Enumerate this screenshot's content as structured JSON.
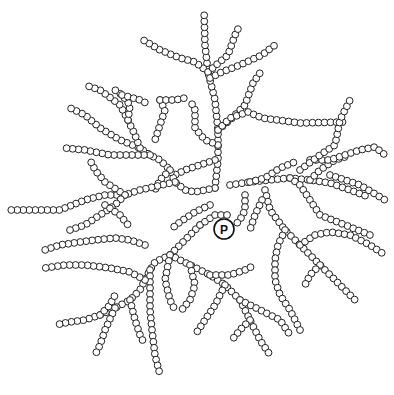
{
  "diagram": {
    "type": "branched-polymer",
    "bead_radius": 3.4,
    "bead_spacing": 6,
    "colors": {
      "stroke": "#222222",
      "fill": "#ffffff",
      "background": "#ffffff"
    },
    "core": {
      "label": "P",
      "x": 224,
      "y": 229,
      "r": 10
    },
    "chains": [
      [
        [
          215,
          188
        ],
        [
          218,
          160
        ],
        [
          218,
          130
        ],
        [
          215,
          100
        ],
        [
          208,
          72
        ],
        [
          205,
          45
        ],
        [
          204,
          10
        ]
      ],
      [
        [
          208,
          72
        ],
        [
          195,
          62
        ],
        [
          180,
          58
        ],
        [
          160,
          50
        ],
        [
          140,
          38
        ]
      ],
      [
        [
          208,
          72
        ],
        [
          228,
          55
        ],
        [
          235,
          35
        ],
        [
          240,
          25
        ]
      ],
      [
        [
          210,
          78
        ],
        [
          222,
          72
        ],
        [
          240,
          65
        ],
        [
          262,
          55
        ],
        [
          275,
          45
        ]
      ],
      [
        [
          218,
          130
        ],
        [
          230,
          120
        ],
        [
          245,
          105
        ],
        [
          253,
          83
        ],
        [
          262,
          70
        ]
      ],
      [
        [
          218,
          130
        ],
        [
          230,
          118
        ],
        [
          248,
          112
        ],
        [
          262,
          118
        ],
        [
          300,
          123
        ],
        [
          345,
          122
        ]
      ],
      [
        [
          218,
          145
        ],
        [
          205,
          140
        ],
        [
          195,
          128
        ],
        [
          195,
          110
        ],
        [
          190,
          100
        ]
      ],
      [
        [
          215,
          160
        ],
        [
          200,
          165
        ],
        [
          185,
          170
        ],
        [
          175,
          175
        ]
      ],
      [
        [
          215,
          188
        ],
        [
          195,
          192
        ],
        [
          185,
          190
        ],
        [
          175,
          182
        ],
        [
          170,
          170
        ],
        [
          160,
          160
        ],
        [
          150,
          155
        ],
        [
          140,
          148
        ],
        [
          120,
          140
        ],
        [
          100,
          128
        ],
        [
          85,
          115
        ],
        [
          70,
          108
        ]
      ],
      [
        [
          150,
          155
        ],
        [
          130,
          155
        ],
        [
          110,
          155
        ],
        [
          85,
          150
        ],
        [
          65,
          148
        ]
      ],
      [
        [
          140,
          148
        ],
        [
          135,
          135
        ],
        [
          128,
          120
        ],
        [
          120,
          105
        ],
        [
          100,
          90
        ],
        [
          85,
          85
        ]
      ],
      [
        [
          170,
          170
        ],
        [
          160,
          180
        ],
        [
          155,
          190
        ]
      ],
      [
        [
          175,
          182
        ],
        [
          140,
          190
        ],
        [
          125,
          195
        ],
        [
          105,
          195
        ],
        [
          85,
          200
        ],
        [
          60,
          210
        ],
        [
          35,
          210
        ],
        [
          10,
          210
        ]
      ],
      [
        [
          125,
          195
        ],
        [
          105,
          182
        ],
        [
          95,
          170
        ],
        [
          90,
          160
        ]
      ],
      [
        [
          125,
          195
        ],
        [
          115,
          205
        ],
        [
          100,
          215
        ],
        [
          85,
          225
        ],
        [
          70,
          230
        ]
      ],
      [
        [
          105,
          205
        ],
        [
          120,
          215
        ],
        [
          128,
          225
        ]
      ],
      [
        [
          128,
          120
        ],
        [
          130,
          105
        ],
        [
          122,
          95
        ],
        [
          115,
          90
        ]
      ],
      [
        [
          122,
          95
        ],
        [
          140,
          100
        ],
        [
          150,
          105
        ]
      ],
      [
        [
          160,
          100
        ],
        [
          165,
          110
        ],
        [
          160,
          125
        ],
        [
          155,
          140
        ]
      ],
      [
        [
          160,
          100
        ],
        [
          175,
          100
        ],
        [
          185,
          98
        ]
      ],
      [
        [
          230,
          185
        ],
        [
          250,
          182
        ],
        [
          270,
          180
        ],
        [
          290,
          178
        ],
        [
          310,
          180
        ],
        [
          330,
          183
        ],
        [
          350,
          190
        ],
        [
          366,
          196
        ]
      ],
      [
        [
          250,
          182
        ],
        [
          265,
          178
        ],
        [
          280,
          168
        ],
        [
          295,
          162
        ]
      ],
      [
        [
          290,
          178
        ],
        [
          300,
          185
        ],
        [
          310,
          200
        ],
        [
          320,
          215
        ],
        [
          345,
          225
        ],
        [
          370,
          235
        ]
      ],
      [
        [
          310,
          180
        ],
        [
          320,
          170
        ],
        [
          335,
          160
        ],
        [
          348,
          156
        ]
      ],
      [
        [
          310,
          160
        ],
        [
          330,
          160
        ],
        [
          345,
          155
        ],
        [
          360,
          150
        ],
        [
          375,
          147
        ],
        [
          385,
          155
        ]
      ],
      [
        [
          300,
          170
        ],
        [
          320,
          155
        ],
        [
          335,
          145
        ],
        [
          340,
          120
        ],
        [
          350,
          100
        ]
      ],
      [
        [
          330,
          175
        ],
        [
          345,
          180
        ],
        [
          360,
          185
        ],
        [
          385,
          200
        ]
      ],
      [
        [
          265,
          190
        ],
        [
          270,
          210
        ],
        [
          285,
          230
        ],
        [
          300,
          245
        ],
        [
          320,
          265
        ],
        [
          340,
          285
        ],
        [
          355,
          300
        ]
      ],
      [
        [
          300,
          245
        ],
        [
          315,
          235
        ],
        [
          330,
          232
        ],
        [
          350,
          235
        ],
        [
          370,
          245
        ],
        [
          385,
          255
        ]
      ],
      [
        [
          285,
          230
        ],
        [
          278,
          245
        ],
        [
          275,
          260
        ],
        [
          275,
          280
        ],
        [
          280,
          295
        ],
        [
          290,
          310
        ],
        [
          300,
          330
        ]
      ],
      [
        [
          320,
          265
        ],
        [
          310,
          275
        ],
        [
          305,
          285
        ]
      ],
      [
        [
          245,
          195
        ],
        [
          245,
          210
        ],
        [
          240,
          220
        ],
        [
          235,
          225
        ]
      ],
      [
        [
          262,
          200
        ],
        [
          255,
          215
        ],
        [
          250,
          230
        ]
      ],
      [
        [
          200,
          225
        ],
        [
          185,
          240
        ],
        [
          170,
          255
        ],
        [
          155,
          262
        ],
        [
          150,
          270
        ],
        [
          145,
          280
        ],
        [
          140,
          290
        ],
        [
          130,
          300
        ],
        [
          115,
          308
        ],
        [
          100,
          315
        ],
        [
          85,
          320
        ],
        [
          70,
          322
        ],
        [
          55,
          325
        ]
      ],
      [
        [
          170,
          255
        ],
        [
          190,
          265
        ],
        [
          210,
          275
        ],
        [
          225,
          285
        ],
        [
          240,
          300
        ],
        [
          250,
          320
        ],
        [
          260,
          340
        ],
        [
          270,
          355
        ]
      ],
      [
        [
          150,
          270
        ],
        [
          150,
          290
        ],
        [
          150,
          310
        ],
        [
          152,
          330
        ],
        [
          155,
          355
        ],
        [
          160,
          375
        ]
      ],
      [
        [
          145,
          280
        ],
        [
          130,
          272
        ],
        [
          110,
          268
        ],
        [
          85,
          265
        ],
        [
          65,
          265
        ],
        [
          45,
          268
        ]
      ],
      [
        [
          130,
          300
        ],
        [
          135,
          320
        ],
        [
          140,
          335
        ],
        [
          145,
          345
        ]
      ],
      [
        [
          100,
          315
        ],
        [
          110,
          305
        ],
        [
          115,
          295
        ]
      ],
      [
        [
          115,
          308
        ],
        [
          105,
          330
        ],
        [
          100,
          345
        ],
        [
          95,
          355
        ]
      ],
      [
        [
          210,
          275
        ],
        [
          230,
          275
        ],
        [
          245,
          270
        ],
        [
          255,
          265
        ]
      ],
      [
        [
          225,
          285
        ],
        [
          215,
          305
        ],
        [
          205,
          320
        ],
        [
          195,
          335
        ]
      ],
      [
        [
          240,
          300
        ],
        [
          260,
          310
        ],
        [
          280,
          320
        ],
        [
          290,
          335
        ]
      ],
      [
        [
          250,
          320
        ],
        [
          240,
          330
        ],
        [
          232,
          340
        ]
      ],
      [
        [
          170,
          255
        ],
        [
          165,
          280
        ],
        [
          170,
          300
        ],
        [
          175,
          310
        ]
      ],
      [
        [
          190,
          265
        ],
        [
          195,
          285
        ],
        [
          190,
          300
        ],
        [
          180,
          312
        ]
      ],
      [
        [
          145,
          245
        ],
        [
          130,
          240
        ],
        [
          115,
          238
        ],
        [
          95,
          240
        ],
        [
          80,
          242
        ],
        [
          60,
          245
        ],
        [
          45,
          250
        ]
      ],
      [
        [
          210,
          205
        ],
        [
          195,
          212
        ],
        [
          180,
          222
        ],
        [
          170,
          230
        ]
      ],
      [
        [
          200,
          225
        ],
        [
          215,
          215
        ],
        [
          232,
          215
        ]
      ]
    ]
  }
}
